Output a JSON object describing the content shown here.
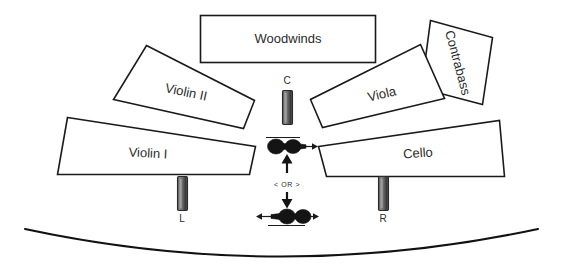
{
  "diagram": {
    "background_color": "#ffffff",
    "outline_color": "#1a1a1a",
    "accent_color": "#141414",
    "width": 562,
    "height": 268
  },
  "sections": [
    {
      "id": "woodwinds",
      "label": "Woodwinds",
      "cx": 288,
      "cy": 39,
      "rotation": 0
    },
    {
      "id": "contrabass",
      "label": "Contrabass",
      "cx": 460,
      "cy": 62,
      "rotation": 70
    },
    {
      "id": "viola",
      "label": "Viola",
      "cx": 384,
      "cy": 94,
      "rotation": -17
    },
    {
      "id": "violin-2",
      "label": "Violin II",
      "cx": 183,
      "cy": 90,
      "rotation": 14
    },
    {
      "id": "violin-1",
      "label": "Violin I",
      "cx": 145,
      "cy": 154,
      "rotation": 4
    },
    {
      "id": "cello",
      "label": "Cello",
      "cx": 424,
      "cy": 155,
      "rotation": -5
    }
  ],
  "microphones": [
    {
      "id": "mic-left",
      "label": "L",
      "x": 182,
      "y": 175,
      "label_x": 182,
      "label_y": 212
    },
    {
      "id": "mic-center",
      "label": "C",
      "x": 287,
      "y": 92,
      "label_x": 287,
      "label_y": 81
    },
    {
      "id": "mic-right",
      "label": "R",
      "x": 383,
      "y": 175,
      "label_x": 383,
      "label_y": 212
    }
  ],
  "center_pair": {
    "or_label": "< OR >",
    "or_x": 287,
    "or_y": 183,
    "upper_option_id": "stereo-pair-narrow",
    "lower_option_id": "stereo-pair-wide",
    "upper_y": 146,
    "lower_y": 215
  },
  "stage_edge": {
    "id": "stage-front-arc",
    "start_x": 25,
    "start_y": 229,
    "end_x": 538,
    "end_y": 229,
    "sag_y": 264
  }
}
